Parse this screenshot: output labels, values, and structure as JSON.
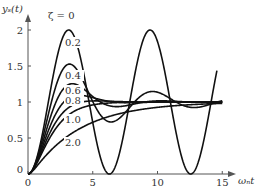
{
  "chart_data": {
    "type": "line",
    "title": "",
    "xlabel": "ωₙt",
    "ylabel": "yₛ(t)",
    "xlim": [
      0,
      15.5
    ],
    "ylim": [
      0,
      2.2
    ],
    "xticks": [
      0,
      5,
      10,
      15
    ],
    "xtick_labels": [
      "0",
      "5",
      "10",
      "15"
    ],
    "yticks": [
      0,
      0.5,
      1,
      1.5,
      2
    ],
    "ytick_labels": [
      "0",
      "0.5",
      "1",
      "1.5",
      "2"
    ],
    "grid": false,
    "legend": "inline labels",
    "series": [
      {
        "name": "ζ=0",
        "label": "ζ = 0",
        "zeta": 0,
        "t_max": 15
      },
      {
        "name": "ζ=0.2",
        "label": "0.2",
        "zeta": 0.2,
        "t_max": 15
      },
      {
        "name": "ζ=0.4",
        "label": "0.4",
        "zeta": 0.4,
        "t_max": 15
      },
      {
        "name": "ζ=0.6",
        "label": "0.6",
        "zeta": 0.6,
        "t_max": 15
      },
      {
        "name": "ζ=0.8",
        "label": "0.8",
        "zeta": 0.8,
        "t_max": 15
      },
      {
        "name": "ζ=1.0",
        "label": "1.0",
        "zeta": 1.0,
        "t_max": 15
      },
      {
        "name": "ζ=2.0",
        "label": "2.0",
        "zeta": 2.0,
        "t_max": 15
      }
    ]
  }
}
